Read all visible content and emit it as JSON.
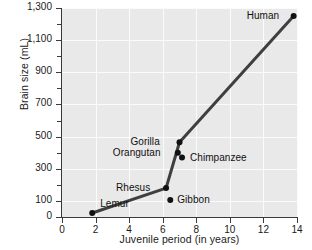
{
  "chart_data": {
    "type": "scatter",
    "title": "",
    "xlabel": "Juvenile period (in years)",
    "ylabel": "Brain size (mL)",
    "xlim": [
      0,
      14
    ],
    "ylim": [
      0,
      1300
    ],
    "grid": true,
    "legend": "none",
    "x_major_ticks": [
      0,
      2,
      4,
      6,
      8,
      10,
      12,
      14
    ],
    "x_tick_labels": [
      "0",
      "2",
      "4",
      "6",
      "8",
      "10",
      "12",
      "14"
    ],
    "y_major_ticks": [
      0,
      100,
      300,
      500,
      700,
      900,
      1100,
      1300
    ],
    "y_tick_labels": [
      "0",
      "100",
      "300",
      "500",
      "700",
      "900",
      "1,100",
      "1,300"
    ],
    "y_minor_ticks": [
      200,
      400,
      600,
      800,
      1000,
      1200
    ],
    "points": [
      {
        "label": "Lemur",
        "x": 1.8,
        "y": 25,
        "label_dx": 8,
        "label_dy": -15
      },
      {
        "label": "Rhesus",
        "x": 6.2,
        "y": 180,
        "label_dx": -50,
        "label_dy": -6
      },
      {
        "label": "Gibbon",
        "x": 6.45,
        "y": 105,
        "label_dx": 7,
        "label_dy": -6
      },
      {
        "label": "Orangutan",
        "x": 6.9,
        "y": 400,
        "label_dx": -65,
        "label_dy": -6
      },
      {
        "label": "Gorilla",
        "x": 7.0,
        "y": 465,
        "label_dx": -49,
        "label_dy": -6
      },
      {
        "label": "Chimpanzee",
        "x": 7.15,
        "y": 370,
        "label_dx": 8,
        "label_dy": -6
      },
      {
        "label": "Human",
        "x": 13.8,
        "y": 1250,
        "label_dx": -47,
        "label_dy": -6
      }
    ],
    "connecting_line_order": [
      "Lemur",
      "Rhesus",
      "Gorilla",
      "Human"
    ],
    "colors": {
      "plot_background": "#e9e9e9",
      "gridline": "#fbfbfb",
      "line": "#3f3f3f",
      "marker": "#111111",
      "axis": "#3a3a3a",
      "text": "#1a1a1a",
      "figure_background": "#ffffff"
    }
  }
}
